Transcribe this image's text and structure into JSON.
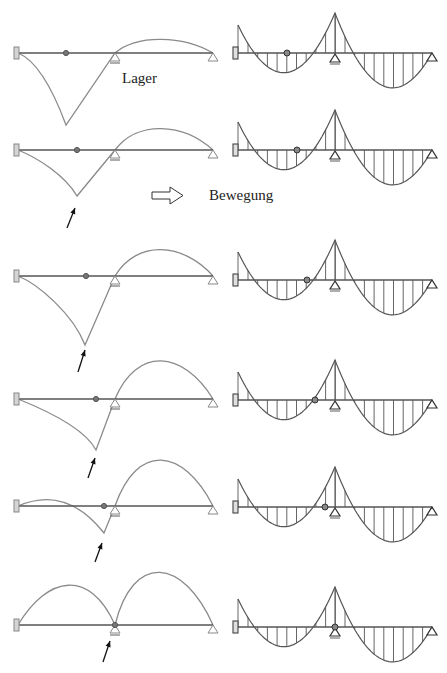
{
  "labels": {
    "support": "Lager",
    "motion": "Bewegung"
  },
  "icons": {
    "motion_arrow": "hollow-right-arrow-icon",
    "load_pointer": "diagonal-pointer-arrow-icon",
    "fixed_support": "clamped-support-icon",
    "roller_support": "triangle-support-icon",
    "hinge": "hinge-dot-icon"
  },
  "colors": {
    "influence_line": "#8a8a8a",
    "beam": "#555555",
    "moment_line": "#555555",
    "arrow": "#111111",
    "support_fill": "#d4d4d4"
  },
  "diagram": {
    "left_beam": {
      "x_clamp": 18,
      "x_mid_support": 115,
      "x_end": 213
    },
    "right_beam": {
      "x_clamp": 238,
      "x_mid_support": 335,
      "x_end": 432
    },
    "rows": [
      {
        "beam_y": 53,
        "hinge_x": 66,
        "dip": [
          66,
          125
        ],
        "arrow": null,
        "arch_peak_y": 39,
        "left_bump_peak_y": null,
        "right_beam_y": 53,
        "right_hinge_x": 287
      },
      {
        "beam_y": 150,
        "hinge_x": 77,
        "dip": [
          77,
          196
        ],
        "arrow": [
          67,
          228,
          75,
          208
        ],
        "arch_peak_y": 128,
        "left_bump_peak_y": null,
        "right_beam_y": 150,
        "right_hinge_x": 297
      },
      {
        "beam_y": 276,
        "hinge_x": 86,
        "dip": [
          85,
          345
        ],
        "arrow": [
          78,
          372,
          85,
          350
        ],
        "arch_peak_y": 249,
        "left_bump_peak_y": null,
        "right_beam_y": 280,
        "right_hinge_x": 307
      },
      {
        "beam_y": 399,
        "hinge_x": 96,
        "dip": [
          96,
          450
        ],
        "arrow": [
          88,
          478,
          95,
          458
        ],
        "arch_peak_y": 360,
        "left_bump_peak_y": null,
        "right_beam_y": 400,
        "right_hinge_x": 315
      },
      {
        "beam_y": 506,
        "hinge_x": 104,
        "dip": [
          104,
          533
        ],
        "arrow": [
          95,
          562,
          102,
          543
        ],
        "arch_peak_y": 459,
        "left_bump_peak_y": 499,
        "right_beam_y": 507,
        "right_hinge_x": 325
      },
      {
        "beam_y": 625,
        "hinge_x": 115,
        "dip": null,
        "arrow": [
          103,
          662,
          110,
          641
        ],
        "arch_peak_y": 571,
        "left_bump_peak_y": 597,
        "right_beam_y": 627,
        "right_hinge_x": 335
      }
    ]
  }
}
